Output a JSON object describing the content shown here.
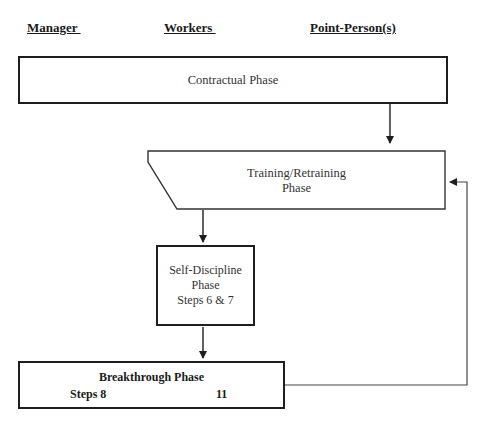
{
  "headers": {
    "manager": "Manager ",
    "workers": "Workers ",
    "point_persons": "Point-Person(s)"
  },
  "phases": {
    "contractual": {
      "label": "Contractual Phase"
    },
    "training": {
      "line1": "Training/Retraining",
      "line2": "Phase"
    },
    "self_discipline": {
      "line1": "Self-Discipline",
      "line2": "Phase",
      "line3": "Steps 6 & 7"
    },
    "breakthrough": {
      "title": "Breakthrough Phase",
      "steps_from": "Steps 8",
      "steps_to": "11"
    }
  },
  "colors": {
    "stroke": "#1e1e1e",
    "text": "#333333",
    "background": "#ffffff"
  }
}
